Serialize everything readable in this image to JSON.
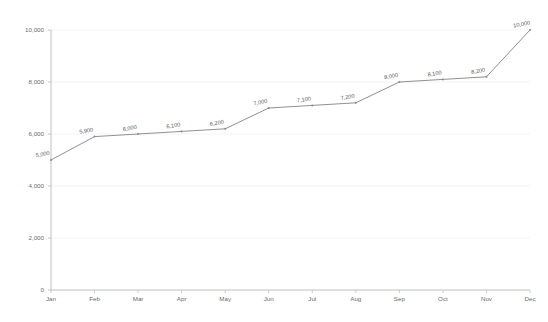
{
  "chart_data": {
    "type": "line",
    "title": "",
    "subtitle": "",
    "xlabel": "",
    "ylabel": "",
    "categories": [
      "Jan",
      "Feb",
      "Mar",
      "Apr",
      "May",
      "Jun",
      "Jul",
      "Aug",
      "Sep",
      "Oct",
      "Nov",
      "Dec"
    ],
    "values": [
      5000,
      5900,
      6000,
      6100,
      6200,
      7000,
      7100,
      7200,
      8000,
      8100,
      8200,
      10000
    ],
    "point_labels": [
      "5,000",
      "5,900",
      "6,000",
      "6,100",
      "6,200",
      "7,000",
      "7,100",
      "7,200",
      "8,000",
      "8,100",
      "8,200",
      "10,000"
    ],
    "ylim": [
      0,
      10000
    ],
    "y_ticks": [
      0,
      2000,
      4000,
      6000,
      8000,
      10000
    ],
    "y_tick_labels": [
      "0",
      "2,000",
      "4,000",
      "6,000",
      "8,000",
      "10,000"
    ],
    "grid": true,
    "grid_axis": "y",
    "legend": false,
    "legend_position": "none",
    "markers": true,
    "series": [
      {
        "name": "",
        "values": [
          5000,
          5900,
          6000,
          6100,
          6200,
          7000,
          7100,
          7200,
          8000,
          8100,
          8200,
          10000
        ]
      }
    ],
    "colors": {
      "line": "#8a8a8a",
      "marker": "#8a8a8a",
      "grid": "#f1f1f3",
      "axis": "#b9b9bd",
      "tick_text": "#6b6b6b",
      "label_text": "#555555",
      "background": "#ffffff"
    }
  }
}
